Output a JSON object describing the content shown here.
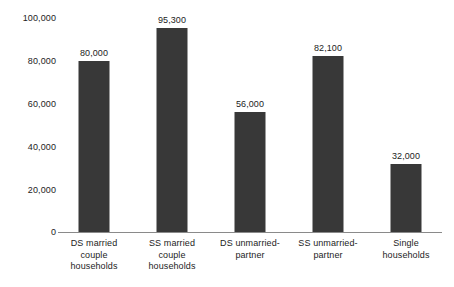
{
  "chart_data": {
    "type": "bar",
    "title": "",
    "subtitle": "",
    "xlabel": "",
    "ylabel": "",
    "ylim": [
      0,
      100000
    ],
    "yticks": [
      "0",
      "20,000",
      "40,000",
      "60,000",
      "80,000",
      "100,000"
    ],
    "ytick_values": [
      0,
      20000,
      40000,
      60000,
      80000,
      100000
    ],
    "grid": false,
    "legend": null,
    "bar_color": "#383838",
    "axis_color": "#8a8a8a",
    "text_color": "#1c1c1c",
    "categories": [
      "DS married couple households",
      "SS married couple households",
      "DS unmarried-partner",
      "SS unmarried-partner",
      "Single households"
    ],
    "category_lines": [
      [
        "DS married",
        "couple",
        "households"
      ],
      [
        "SS married",
        "couple",
        "households"
      ],
      [
        "DS unmarried-",
        "partner"
      ],
      [
        "SS unmarried-",
        "partner"
      ],
      [
        "Single",
        "households"
      ]
    ],
    "values": [
      80000,
      95300,
      56000,
      82100,
      32000
    ],
    "value_labels": [
      "80,000",
      "95,300",
      "56,000",
      "82,100",
      "32,000"
    ]
  }
}
